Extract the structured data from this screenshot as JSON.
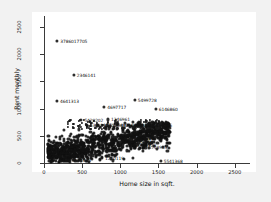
{
  "chart_data": {
    "type": "scatter",
    "title": "",
    "xlabel": "Home size in sqft.",
    "ylabel": "Rent monthly",
    "xlim": [
      0,
      2700
    ],
    "ylim": [
      0,
      2700
    ],
    "xticks": [
      0,
      500,
      1000,
      1500,
      2000,
      2500
    ],
    "yticks": [
      0,
      500,
      1000,
      1500,
      2000,
      2500
    ],
    "xticklabels": [
      "0",
      "500",
      "1000",
      "1500",
      "2000",
      "2500"
    ],
    "yticklabels": [
      "0",
      "500",
      "1000",
      "1500",
      "2000",
      "2500"
    ],
    "grid": false,
    "legend": null,
    "marker": "filled-circle",
    "marker_color": "#1b1b1b",
    "background": "#ffffff",
    "figure_background": "#f2f2f2",
    "labeled_points": [
      {
        "label": "3786017705",
        "x": 175,
        "y": 2250
      },
      {
        "label": "2346141",
        "x": 390,
        "y": 1610
      },
      {
        "label": "4641313",
        "x": 170,
        "y": 1140
      },
      {
        "label": "5499728",
        "x": 1190,
        "y": 1155
      },
      {
        "label": "4697717",
        "x": 790,
        "y": 1025
      },
      {
        "label": "6146860",
        "x": 1465,
        "y": 1000
      },
      {
        "label": "5428202",
        "x": 490,
        "y": 790
      },
      {
        "label": "1346961",
        "x": 840,
        "y": 800
      },
      {
        "label": "1411356",
        "x": 1390,
        "y": 690
      },
      {
        "label": "5541368",
        "x": 1530,
        "y": 40
      }
    ],
    "cluster": {
      "description": "Dense cloud of rental listings",
      "x_range": [
        50,
        1650
      ],
      "y_range": [
        20,
        760
      ],
      "center": [
        700,
        330
      ],
      "n_points_drawn": 900
    }
  },
  "axes": {
    "x_title": "Home size in sqft.",
    "y_title": "Rent monthly"
  }
}
